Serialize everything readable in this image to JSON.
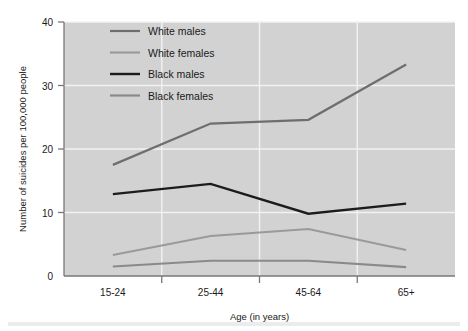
{
  "chart_data": {
    "type": "line",
    "title": "",
    "xlabel": "Age (in years)",
    "ylabel": "Number of suicides per 100,000 people",
    "categories": [
      "15-24",
      "25-44",
      "45-64",
      "65+"
    ],
    "ylim": [
      0,
      40
    ],
    "yticks": [
      0,
      10,
      20,
      30,
      40
    ],
    "ytick_labels": [
      "0",
      "10",
      "20",
      "30",
      "40"
    ],
    "grid": true,
    "legend_position": "top-left-inside",
    "plot_background": "#d2d2d2",
    "series": [
      {
        "name": "White males",
        "color": "#6e6e6e",
        "width": 2.2,
        "values": [
          17.5,
          24.0,
          24.6,
          33.3
        ]
      },
      {
        "name": "White females",
        "color": "#9a9a9a",
        "width": 2.2,
        "values": [
          3.3,
          6.3,
          7.4,
          4.1
        ]
      },
      {
        "name": "Black males",
        "color": "#1c1c1c",
        "width": 2.4,
        "values": [
          12.9,
          14.5,
          9.8,
          11.4
        ]
      },
      {
        "name": "Black females",
        "color": "#8a8a8a",
        "width": 2.2,
        "values": [
          1.5,
          2.4,
          2.4,
          1.4
        ]
      }
    ]
  },
  "legend": {
    "items": [
      {
        "label": "White males"
      },
      {
        "label": "White females"
      },
      {
        "label": "Black males"
      },
      {
        "label": "Black females"
      }
    ]
  }
}
